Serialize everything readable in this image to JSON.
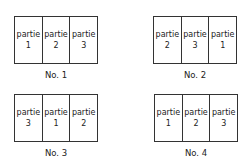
{
  "arrangements": [
    {
      "caption": "No. 1",
      "parts": [
        {
          "word": "partie",
          "num": "1"
        },
        {
          "word": "partie",
          "num": "2"
        },
        {
          "word": "partie",
          "num": "3"
        }
      ]
    },
    {
      "caption": "No. 2",
      "parts": [
        {
          "word": "partie",
          "num": "2"
        },
        {
          "word": "partie",
          "num": "3"
        },
        {
          "word": "partie",
          "num": "1"
        }
      ]
    },
    {
      "caption": "No. 3",
      "parts": [
        {
          "word": "partie",
          "num": "3"
        },
        {
          "word": "partie",
          "num": "1"
        },
        {
          "word": "partie",
          "num": "2"
        }
      ]
    },
    {
      "caption": "No. 4",
      "parts": [
        {
          "word": "partie",
          "num": "1"
        },
        {
          "word": "partie",
          "num": "2"
        },
        {
          "word": "partie",
          "num": "3"
        }
      ]
    }
  ]
}
